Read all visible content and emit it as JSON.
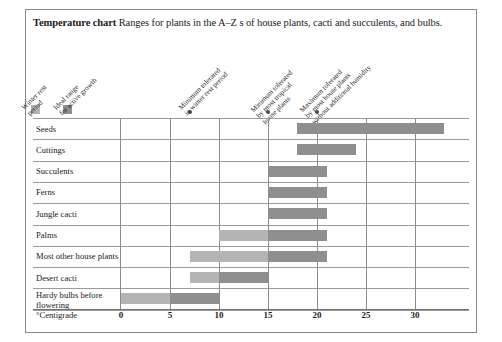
{
  "title": {
    "bold": "Temperature chart",
    "rest": " Ranges for plants in the A–Z s of house plants, cacti and succulents, and bulbs."
  },
  "legend": {
    "items": [
      {
        "label_line1": "Winter rest",
        "label_line2": "period",
        "type": "swatch",
        "color": "#b4b4b4",
        "value": null
      },
      {
        "label_line1": "Ideal range",
        "label_line2": "for active growth",
        "type": "swatch",
        "color": "#8f8f8f",
        "value": null
      },
      {
        "label_line1": "Minimum tolerated",
        "label_line2": "in winter rest period",
        "type": "dot",
        "color": "#4a4a4a",
        "value": 7
      },
      {
        "label_line1": "Minimum tolerated",
        "label_line2": "by most tropical",
        "label_line3": "house plants",
        "type": "dot",
        "color": "#4a4a4a",
        "value": 15
      },
      {
        "label_line1": "Maximum tolerated",
        "label_line2": "by most house plants",
        "label_line3": "without additional humidity",
        "type": "dot",
        "color": "#4a4a4a",
        "value": 20
      }
    ]
  },
  "axis": {
    "unit_label": "°Centigrade",
    "ticks": [
      0,
      5,
      10,
      15,
      20,
      25,
      30
    ],
    "min": 0,
    "max": 35
  },
  "chart_data": {
    "type": "bar",
    "orientation": "horizontal",
    "title": "Temperature chart",
    "subtitle": "Ranges for plants in the A–Z s of house plants, cacti and succulents, and bulbs.",
    "xlabel": "°Centigrade",
    "ylabel": "",
    "xlim": [
      0,
      35
    ],
    "xticks": [
      0,
      5,
      10,
      15,
      20,
      25,
      30
    ],
    "grid": true,
    "legend_position": "top-left-rotated",
    "series": [
      {
        "name": "Winter rest period",
        "color": "#b4b4b4"
      },
      {
        "name": "Ideal range for active growth",
        "color": "#8f8f8f"
      }
    ],
    "markers": [
      {
        "name": "Minimum tolerated in winter rest period",
        "value": 7
      },
      {
        "name": "Minimum tolerated by most tropical house plants",
        "value": 15
      },
      {
        "name": "Maximum tolerated by most house plants without additional humidity",
        "value": 20
      }
    ],
    "categories": [
      "Seeds",
      "Cuttings",
      "Succulents",
      "Ferns",
      "Jungle cacti",
      "Palms",
      "Most other house plants",
      "Desert cacti",
      "Hardy bulbs before flowering"
    ],
    "rows": [
      {
        "label": "Seeds",
        "winter_rest": null,
        "ideal": [
          18,
          33
        ]
      },
      {
        "label": "Cuttings",
        "winter_rest": null,
        "ideal": [
          18,
          24
        ]
      },
      {
        "label": "Succulents",
        "winter_rest": null,
        "ideal": [
          15,
          21
        ]
      },
      {
        "label": "Ferns",
        "winter_rest": null,
        "ideal": [
          15,
          21
        ]
      },
      {
        "label": "Jungle cacti",
        "winter_rest": null,
        "ideal": [
          15,
          21
        ]
      },
      {
        "label": "Palms",
        "winter_rest": [
          10,
          15
        ],
        "ideal": [
          15,
          21
        ]
      },
      {
        "label": "Most other house plants",
        "winter_rest": [
          7,
          15
        ],
        "ideal": [
          15,
          21
        ]
      },
      {
        "label": "Desert cacti",
        "winter_rest": [
          7,
          10
        ],
        "ideal": [
          10,
          15
        ]
      },
      {
        "label": "Hardy bulbs before flowering",
        "winter_rest": [
          0,
          5
        ],
        "ideal": [
          5,
          10
        ]
      }
    ]
  }
}
